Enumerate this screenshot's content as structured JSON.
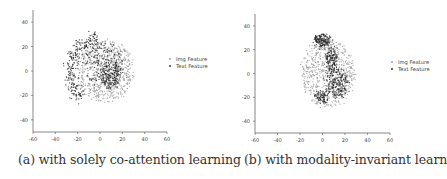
{
  "chart_data": [
    {
      "type": "scatter",
      "title": "",
      "xlabel": "",
      "ylabel": "",
      "xlim": [
        -60,
        60
      ],
      "ylim": [
        -50,
        50
      ],
      "xticks": [
        -60,
        -40,
        -20,
        0,
        20,
        40,
        60
      ],
      "yticks": [
        40,
        20,
        0,
        -20,
        -40
      ],
      "grid": false,
      "legend": {
        "position": "right",
        "entries": [
          "Img Feature",
          "Text Feature"
        ]
      },
      "series": [
        {
          "name": "Img Feature",
          "color": "#9a9a9a",
          "clusters": [
            {
              "cx": 5,
              "cy": 0,
              "rx": 25,
              "ry": 25,
              "n": 700
            }
          ]
        },
        {
          "name": "Text Feature",
          "color": "#222222",
          "clusters": [
            {
              "arc": true,
              "cx": 0,
              "cy": 0,
              "r": 27,
              "startDeg": 95,
              "endDeg": 235,
              "width": 3,
              "n": 260
            },
            {
              "cx": 10,
              "cy": -3,
              "rx": 8,
              "ry": 12,
              "n": 160
            },
            {
              "cx": 3,
              "cy": 5,
              "rx": 18,
              "ry": 18,
              "n": 200
            }
          ]
        }
      ],
      "caption": "(a) with solely co-attention learning"
    },
    {
      "type": "scatter",
      "title": "",
      "xlabel": "",
      "ylabel": "",
      "xlim": [
        -60,
        60
      ],
      "ylim": [
        -50,
        50
      ],
      "xticks": [
        -60,
        -40,
        -20,
        0,
        20,
        40,
        60
      ],
      "yticks": [
        40,
        20,
        0,
        -20,
        -40
      ],
      "grid": false,
      "legend": {
        "position": "right",
        "entries": [
          "Img Feature",
          "Text Feature"
        ]
      },
      "series": [
        {
          "name": "Img Feature",
          "color": "#9a9a9a",
          "clusters": [
            {
              "cx": 5,
              "cy": 0,
              "rx": 24,
              "ry": 28,
              "n": 650
            }
          ]
        },
        {
          "name": "Text Feature",
          "color": "#222222",
          "clusters": [
            {
              "cx": 0,
              "cy": 28,
              "rx": 7,
              "ry": 5,
              "n": 160
            },
            {
              "cx": 8,
              "cy": 12,
              "rx": 5,
              "ry": 10,
              "n": 140
            },
            {
              "cx": 12,
              "cy": -8,
              "rx": 10,
              "ry": 12,
              "n": 220
            },
            {
              "cx": 0,
              "cy": -20,
              "rx": 6,
              "ry": 5,
              "n": 90
            }
          ]
        }
      ],
      "caption": "(b) with modality-invariant learning"
    }
  ],
  "captions": {
    "a": "(a) with solely co-attention learning",
    "b": "(b) with modality-invariant learning"
  }
}
